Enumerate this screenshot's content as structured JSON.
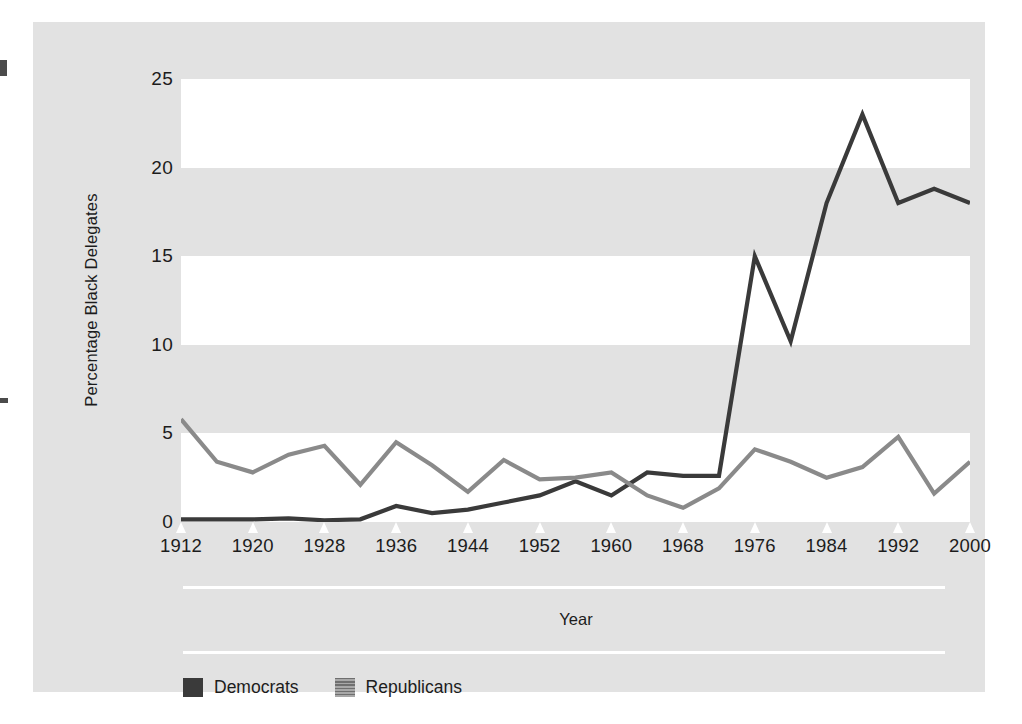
{
  "chart_data": {
    "type": "line",
    "title": "",
    "xlabel": "Year",
    "ylabel": "Percentage Black Delegates",
    "xlim": [
      1912,
      2000
    ],
    "ylim": [
      0,
      25
    ],
    "yticks": [
      0,
      5,
      10,
      15,
      20,
      25
    ],
    "ytick_labels": [
      "0",
      "5",
      "10",
      "15",
      "20",
      "25"
    ],
    "xticks": [
      1912,
      1920,
      1928,
      1936,
      1944,
      1952,
      1960,
      1968,
      1976,
      1984,
      1992,
      2000
    ],
    "xtick_labels": [
      "1912",
      "1920",
      "1928",
      "1936",
      "1944",
      "1952",
      "1960",
      "1968",
      "1976",
      "1984",
      "1992",
      "2000"
    ],
    "grid": "alternating-horizontal-bands",
    "legend_position": "bottom-left",
    "x": [
      1912,
      1916,
      1920,
      1924,
      1928,
      1932,
      1936,
      1940,
      1944,
      1948,
      1952,
      1956,
      1960,
      1964,
      1968,
      1972,
      1976,
      1980,
      1984,
      1988,
      1992,
      1996,
      2000
    ],
    "series": [
      {
        "name": "Democrats",
        "color": "#3a3a3a",
        "values": [
          0.15,
          0.15,
          0.15,
          0.2,
          0.1,
          0.15,
          0.9,
          0.5,
          0.7,
          1.1,
          1.5,
          2.3,
          1.5,
          2.8,
          2.6,
          2.6,
          15.0,
          10.2,
          18.0,
          23.0,
          18.0,
          18.8,
          18.0
        ]
      },
      {
        "name": "Republicans",
        "color": "#8a8a8a",
        "values": [
          5.8,
          3.4,
          2.8,
          3.8,
          4.3,
          2.1,
          4.5,
          3.2,
          1.7,
          3.5,
          2.4,
          2.5,
          2.8,
          1.5,
          0.8,
          1.9,
          4.1,
          3.4,
          2.5,
          3.1,
          4.8,
          1.6,
          3.4
        ]
      }
    ],
    "bands": [
      {
        "from": 25,
        "to": 20,
        "fill": "#ffffff"
      },
      {
        "from": 20,
        "to": 15,
        "fill": "#e2e2e2"
      },
      {
        "from": 15,
        "to": 10,
        "fill": "#ffffff"
      },
      {
        "from": 10,
        "to": 5,
        "fill": "#e2e2e2"
      },
      {
        "from": 5,
        "to": 0,
        "fill": "#ffffff"
      }
    ]
  },
  "legend": {
    "items": [
      {
        "label": "Democrats",
        "swatch": "solid-dark-square"
      },
      {
        "label": "Republicans",
        "swatch": "striped-gray-square"
      }
    ]
  },
  "colors": {
    "panel_background": "#e2e2e2",
    "band_light": "#ffffff",
    "democrat_line": "#3a3a3a",
    "republican_line": "#8a8a8a",
    "text": "#1c1c1c"
  }
}
